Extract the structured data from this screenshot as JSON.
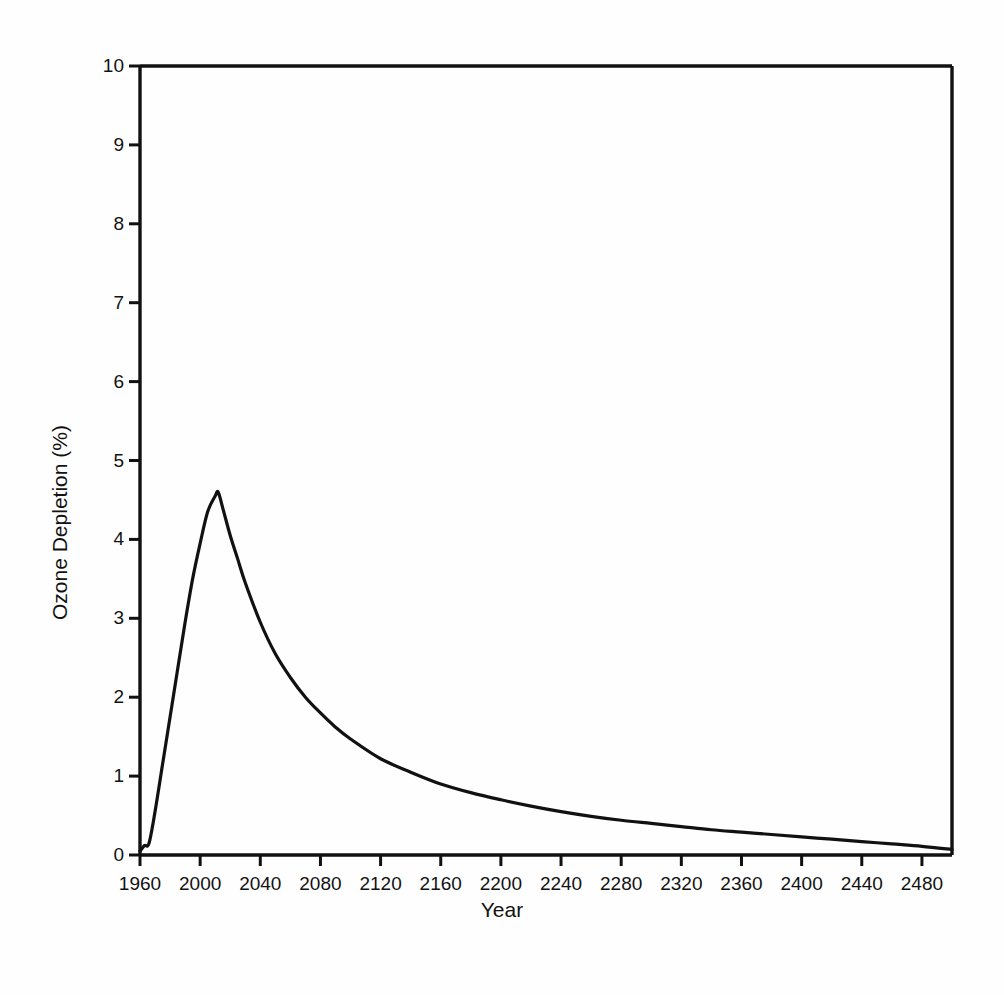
{
  "chart_data": {
    "type": "line",
    "title": "",
    "xlabel": "Year",
    "ylabel": "Ozone Depletion (%)",
    "xlim": [
      1960,
      2500
    ],
    "ylim": [
      0,
      10
    ],
    "grid": false,
    "legend": null,
    "xticks": [
      1960,
      2000,
      2040,
      2080,
      2120,
      2160,
      2200,
      2240,
      2280,
      2320,
      2360,
      2400,
      2440,
      2480
    ],
    "xtick_labels": [
      "1960",
      "2000",
      "2040",
      "2080",
      "2120",
      "2160",
      "2200",
      "2240",
      "2280",
      "2320",
      "2360",
      "2400",
      "2440",
      "2480"
    ],
    "yticks": [
      0,
      1,
      2,
      3,
      4,
      5,
      6,
      7,
      8,
      9,
      10
    ],
    "ytick_labels": [
      "0",
      "1",
      "2",
      "3",
      "4",
      "5",
      "6",
      "7",
      "8",
      "9",
      "10"
    ],
    "series": [
      {
        "name": "Ozone Depletion",
        "color": "#111111",
        "line_width": 3.2,
        "x": [
          1960,
          1963,
          1966,
          1970,
          1975,
          1980,
          1985,
          1990,
          1995,
          2000,
          2005,
          2010,
          2012,
          2015,
          2020,
          2025,
          2030,
          2040,
          2050,
          2060,
          2070,
          2080,
          2090,
          2100,
          2120,
          2140,
          2160,
          2180,
          2200,
          2220,
          2240,
          2260,
          2280,
          2300,
          2320,
          2340,
          2360,
          2380,
          2400,
          2420,
          2440,
          2460,
          2480,
          2500
        ],
        "y": [
          0.05,
          0.12,
          0.15,
          0.55,
          1.15,
          1.75,
          2.35,
          2.95,
          3.5,
          3.95,
          4.35,
          4.55,
          4.6,
          4.4,
          4.05,
          3.75,
          3.45,
          2.95,
          2.55,
          2.25,
          2.0,
          1.8,
          1.62,
          1.47,
          1.22,
          1.05,
          0.9,
          0.79,
          0.7,
          0.62,
          0.55,
          0.49,
          0.44,
          0.4,
          0.36,
          0.32,
          0.29,
          0.26,
          0.23,
          0.2,
          0.17,
          0.14,
          0.11,
          0.07
        ]
      }
    ],
    "annotations": {
      "peak_year": 2012,
      "peak_value": 4.6,
      "start_value": 0.05,
      "end_value": 0.07
    }
  },
  "axes": {
    "x_title": "Year",
    "y_title": "Ozone Depletion (%)"
  },
  "colors": {
    "line": "#111111",
    "axis": "#111111",
    "background": "#fefefe",
    "text": "#121212"
  }
}
